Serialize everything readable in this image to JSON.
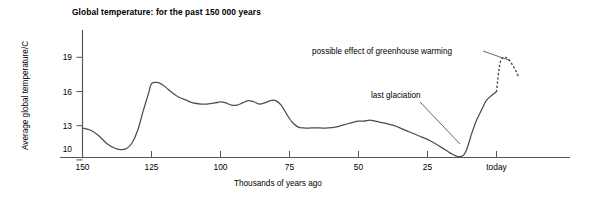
{
  "chart_data": {
    "type": "line",
    "title": "Global temperature: for the past 150 000 years",
    "xlabel": "Thousands of years ago",
    "ylabel": "Average global temperature/C",
    "xlim": [
      150,
      -10
    ],
    "ylim": [
      9.0,
      20.2
    ],
    "grid": false,
    "legend": "none",
    "xticks": [
      {
        "value": 150,
        "label": "150"
      },
      {
        "value": 125,
        "label": "125"
      },
      {
        "value": 100,
        "label": "100"
      },
      {
        "value": 75,
        "label": "75"
      },
      {
        "value": 50,
        "label": "50"
      },
      {
        "value": 25,
        "label": "25"
      },
      {
        "value": 0,
        "label": "today"
      }
    ],
    "yticks": [
      {
        "value": 19,
        "label": "19"
      },
      {
        "value": 16,
        "label": "16"
      },
      {
        "value": 13,
        "label": "13"
      },
      {
        "value": 10,
        "label": "10"
      }
    ],
    "series": [
      {
        "name": "observed global temperature",
        "style": "solid",
        "x": [
          150,
          147,
          144,
          141,
          138,
          136,
          134,
          132,
          130,
          128,
          126,
          125,
          123,
          121,
          119,
          117,
          115,
          112,
          110,
          107,
          105,
          102,
          100,
          98,
          96,
          94,
          92,
          90,
          88,
          86,
          84,
          82,
          80,
          78,
          76,
          74,
          72,
          70,
          67,
          64,
          61,
          58,
          55,
          52,
          50,
          48,
          46,
          44,
          42,
          40,
          37,
          34,
          31,
          28,
          25,
          22,
          20,
          18,
          16,
          14,
          13,
          12,
          11,
          10,
          9,
          8,
          7,
          6,
          5,
          4,
          3,
          2,
          1,
          0
        ],
        "y": [
          12.8,
          12.6,
          12.1,
          11.4,
          11.0,
          10.9,
          11.0,
          11.5,
          12.6,
          14.3,
          15.9,
          16.7,
          16.8,
          16.6,
          16.2,
          15.8,
          15.5,
          15.2,
          15.0,
          14.9,
          14.9,
          15.0,
          15.1,
          15.0,
          14.8,
          14.8,
          15.0,
          15.2,
          15.1,
          14.9,
          15.0,
          15.2,
          15.2,
          14.8,
          14.0,
          13.3,
          12.9,
          12.8,
          12.8,
          12.8,
          12.8,
          12.9,
          13.1,
          13.3,
          13.4,
          13.4,
          13.5,
          13.4,
          13.3,
          13.2,
          13.0,
          12.7,
          12.4,
          12.1,
          11.8,
          11.4,
          11.1,
          10.8,
          10.5,
          10.3,
          10.3,
          10.4,
          10.8,
          11.5,
          12.3,
          13.0,
          13.6,
          14.1,
          14.6,
          15.1,
          15.4,
          15.6,
          15.8,
          16.0
        ]
      },
      {
        "name": "possible effect of greenhouse warming",
        "style": "dotted",
        "x": [
          0,
          -0.4,
          -0.9,
          -1.4,
          -2.0,
          -2.6,
          -3.3,
          -4.0,
          -4.8,
          -5.6,
          -6.4,
          -7.2,
          -8.0
        ],
        "y": [
          16.0,
          16.9,
          17.9,
          18.6,
          18.9,
          19.0,
          19.0,
          18.9,
          18.7,
          18.4,
          18.1,
          17.7,
          17.3
        ]
      }
    ],
    "annotations": [
      {
        "text": "possible effect of greenhouse warming",
        "target": {
          "x": -1.6,
          "y": 18.7
        }
      },
      {
        "text": "last glaciation",
        "target": {
          "x": 12.6,
          "y": 10.35
        }
      }
    ]
  }
}
